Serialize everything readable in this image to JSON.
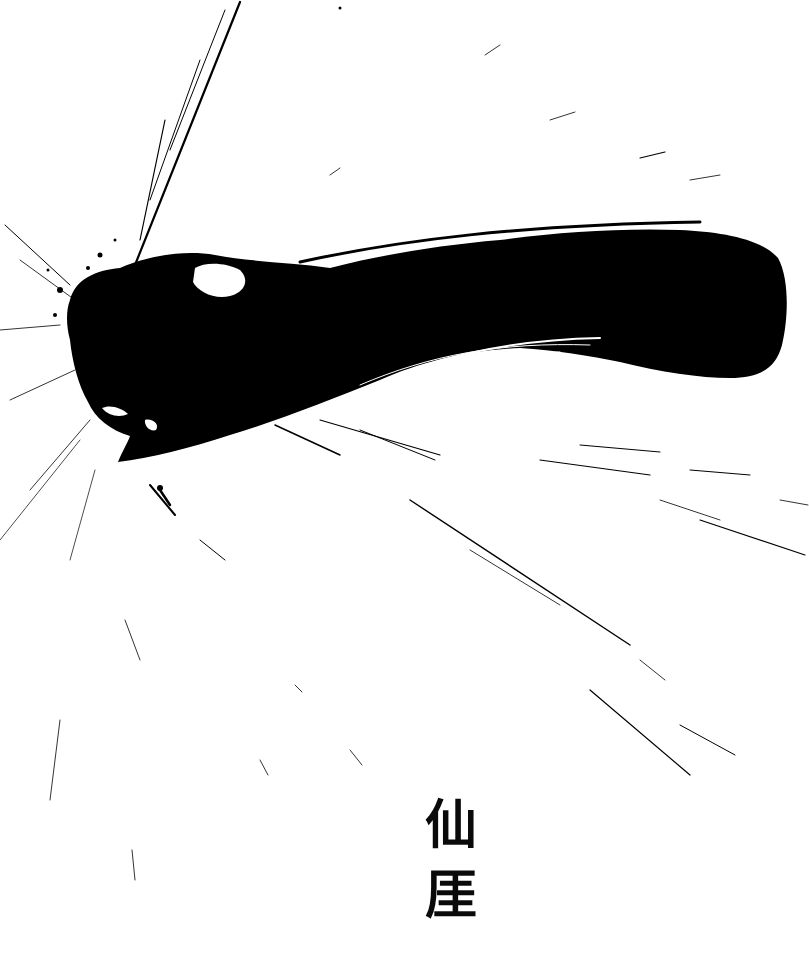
{
  "artwork": {
    "subject": "single horizontal ink brushstroke with radiating splatter",
    "ink_color": "#000000",
    "paper_color": "#ffffff"
  },
  "signature": {
    "char_1": "仙",
    "char_2": "厓"
  }
}
